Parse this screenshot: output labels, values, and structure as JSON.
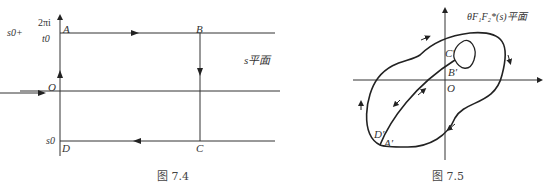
{
  "figure_left": {
    "caption": "图 7.4",
    "plane_label": "s平面",
    "points": {
      "A": "A",
      "B": "B",
      "C": "C",
      "D": "D",
      "O": "O"
    },
    "y_label_top_prefix": "s0+",
    "y_label_top_num": "2πi",
    "y_label_top_den": "t0",
    "y_label_bottom": "s0",
    "contour": [
      "A→B",
      "B→C",
      "C→D",
      "D→A"
    ]
  },
  "figure_right": {
    "caption": "图 7.5",
    "plane_label": "θF₁F₂*(s)平面",
    "points": {
      "A": "A′",
      "B": "B′",
      "C": "C′",
      "D": "D′",
      "O": "O"
    }
  }
}
